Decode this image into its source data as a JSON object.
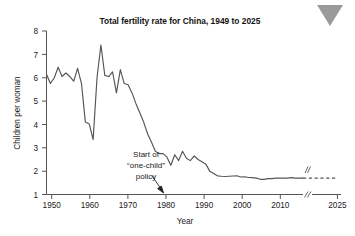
{
  "decoration": {
    "corner_marker": "triangle-down",
    "corner_marker_color": "#9a9a9a"
  },
  "chart_data": {
    "type": "line",
    "title": "Total fertility rate for China, 1949 to 2025",
    "xlabel": "Year",
    "ylabel": "Children per woman",
    "xlim": [
      1949,
      2025
    ],
    "ylim": [
      1,
      8
    ],
    "xticks": [
      1950,
      1960,
      1970,
      1980,
      1990,
      2000,
      2010,
      2025
    ],
    "xtick_labels": [
      "1950",
      "1960",
      "1970",
      "1980",
      "1990",
      "2000",
      "2010",
      "2025"
    ],
    "yticks": [
      1,
      2,
      3,
      4,
      5,
      6,
      7,
      8
    ],
    "ytick_labels": [
      "1",
      "2",
      "3",
      "4",
      "5",
      "6",
      "7",
      "8"
    ],
    "grid": false,
    "legend": "none",
    "line_color": "#555555",
    "axis_break": {
      "axis": "x",
      "between": [
        2015,
        2024
      ],
      "marker": "//"
    },
    "series": [
      {
        "name": "Total fertility rate",
        "style": "solid",
        "x": [
          1949,
          1950,
          1951,
          1952,
          1953,
          1954,
          1955,
          1956,
          1957,
          1958,
          1959,
          1960,
          1961,
          1962,
          1963,
          1964,
          1965,
          1966,
          1967,
          1968,
          1969,
          1970,
          1971,
          1972,
          1973,
          1974,
          1975,
          1976,
          1977,
          1978,
          1979,
          1980,
          1981,
          1982,
          1983,
          1984,
          1985,
          1986,
          1987,
          1988,
          1989,
          1990,
          1991,
          1992,
          1993,
          1994,
          1995,
          1996,
          1997,
          1998,
          1999,
          2000,
          2001,
          2002,
          2003,
          2004,
          2005,
          2006,
          2007,
          2008,
          2009,
          2010,
          2011,
          2012,
          2013,
          2014,
          2015
        ],
        "values": [
          6.15,
          5.75,
          6.0,
          6.45,
          6.05,
          6.2,
          6.05,
          5.85,
          6.4,
          5.75,
          4.1,
          4.02,
          3.35,
          6.0,
          7.4,
          6.1,
          6.05,
          6.25,
          5.35,
          6.35,
          5.75,
          5.7,
          5.35,
          4.9,
          4.5,
          4.1,
          3.6,
          3.25,
          2.85,
          2.75,
          2.75,
          2.6,
          2.25,
          2.7,
          2.45,
          2.85,
          2.55,
          2.45,
          2.65,
          2.5,
          2.4,
          2.3,
          2.0,
          1.9,
          1.8,
          1.78,
          1.77,
          1.78,
          1.79,
          1.8,
          1.75,
          1.76,
          1.73,
          1.72,
          1.7,
          1.65,
          1.65,
          1.68,
          1.68,
          1.7,
          1.7,
          1.7,
          1.7,
          1.72,
          1.7,
          1.7,
          1.7
        ]
      },
      {
        "name": "Projection",
        "style": "dashed",
        "x": [
          2015,
          2025
        ],
        "values": [
          1.7,
          1.7
        ]
      }
    ],
    "annotations": [
      {
        "name": "one-child-policy",
        "lines": [
          "Start of",
          "“one-child”",
          "policy"
        ],
        "points_to_year": 1979,
        "points_to_value": 1.0
      }
    ]
  }
}
